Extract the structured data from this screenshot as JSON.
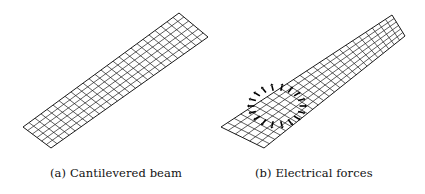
{
  "figure": {
    "panels": [
      {
        "id": "a",
        "caption": "(a) Cantilevered beam",
        "description": "isometric mesh of a cantilevered beam",
        "mesh": {
          "corners": {
            "far_tip": [
              179,
              13
            ],
            "far_side": [
              208,
              37
            ],
            "near_tip": [
              51,
              148
            ],
            "near_side": [
              23,
              127
            ]
          },
          "length_divisions": 26,
          "width_divisions": 6,
          "line_color": "#1a1a1a"
        }
      },
      {
        "id": "b",
        "caption": "(b) Electrical forces",
        "description": "isometric mesh with ring of electrical force arrows",
        "mesh": {
          "corners": {
            "far_tip": [
              180,
              15
            ],
            "far_side": [
              193,
              36
            ],
            "near_tip": [
              52,
              148
            ],
            "near_side": [
              9,
              127
            ]
          },
          "length_divisions": 26,
          "width_divisions": 6,
          "line_color": "#1a1a1a"
        },
        "force_ring": {
          "center": [
            65,
            106
          ],
          "rx": 24,
          "ry": 17,
          "arrow_count": 18,
          "color": "#000000"
        }
      }
    ]
  }
}
